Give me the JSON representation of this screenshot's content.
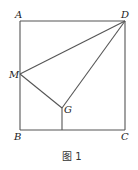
{
  "figure": {
    "caption": "图 1",
    "points": {
      "A": {
        "label": "A",
        "x": 20,
        "y": 21
      },
      "D": {
        "label": "D",
        "x": 125,
        "y": 21
      },
      "B": {
        "label": "B",
        "x": 20,
        "y": 130
      },
      "C": {
        "label": "C",
        "x": 125,
        "y": 130
      },
      "M": {
        "label": "M",
        "x": 20,
        "y": 74
      },
      "G": {
        "label": "G",
        "x": 62,
        "y": 108
      }
    },
    "segments": [
      "AB",
      "BC",
      "CD",
      "DA",
      "DM",
      "DG",
      "MG",
      "G-foot on BC"
    ]
  }
}
